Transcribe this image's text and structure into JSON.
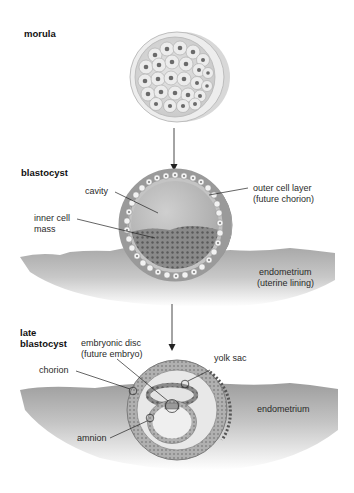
{
  "figure": {
    "stages": [
      {
        "id": "morula",
        "title": "morula"
      },
      {
        "id": "blastocyst",
        "title": "blastocyst"
      },
      {
        "id": "late_blastocyst",
        "title_line1": "late",
        "title_line2": "blastocyst"
      }
    ],
    "blastocyst_labels": {
      "cavity": "cavity",
      "inner_cell_mass_line1": "inner cell",
      "inner_cell_mass_line2": "mass",
      "outer_layer_line1": "outer cell layer",
      "outer_layer_line2": "(future chorion)",
      "endometrium_line1": "endometrium",
      "endometrium_line2": "(uterine lining)"
    },
    "late_labels": {
      "embryonic_disc_line1": "embryonic disc",
      "embryonic_disc_line2": "(future embryo)",
      "yolk_sac": "yolk sac",
      "chorion": "chorion",
      "endometrium": "endometrium",
      "amnion": "amnion"
    },
    "colors": {
      "text": "#2a2a2a",
      "tissue": "#9a9a9a",
      "cell_fill": "#e6e6e6",
      "nucleus": "#6e6e6e",
      "arrow": "#222222"
    }
  }
}
